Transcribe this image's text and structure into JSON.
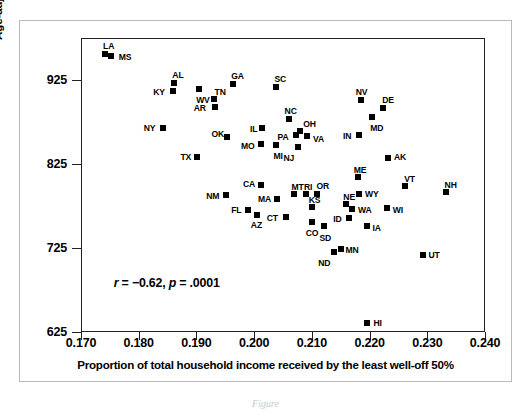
{
  "chart_data": {
    "type": "scatter",
    "title": "",
    "xlabel": "Proportion of total household income received by the least well-off 50%",
    "ylabel": "Age-adjusted total mortality per 100,000",
    "xlim": [
      0.17,
      0.24
    ],
    "ylim": [
      625,
      975
    ],
    "xticks": [
      "0.170",
      "0.180",
      "0.190",
      "0.200",
      "0.210",
      "0.220",
      "0.230",
      "0.240"
    ],
    "xtick_values": [
      0.17,
      0.18,
      0.19,
      0.2,
      0.21,
      0.22,
      0.23,
      0.24
    ],
    "yticks": [
      "925",
      "825",
      "725",
      "625"
    ],
    "ytick_values": [
      925,
      825,
      725,
      625
    ],
    "grid": false,
    "legend": "none",
    "annotation": "r = −0.62, p = .0001",
    "annotation_parts": {
      "r_symbol": "r",
      "r_text": " = −0.62, ",
      "p_symbol": "p",
      "p_text": " = .0001"
    },
    "marker": "filled-square",
    "marker_color": "#000000",
    "points": [
      {
        "label": "LA",
        "x": 0.174,
        "y": 957,
        "lx": -2,
        "ly": -13
      },
      {
        "label": "MS",
        "x": 0.175,
        "y": 955,
        "lx": 8,
        "ly": -4
      },
      {
        "label": "AL",
        "x": 0.186,
        "y": 923,
        "lx": -2,
        "ly": -13
      },
      {
        "label": "KY",
        "x": 0.1858,
        "y": 913,
        "lx": -20,
        "ly": -4
      },
      {
        "label": "WV",
        "x": 0.1903,
        "y": 916,
        "lx": -3,
        "ly": 6
      },
      {
        "label": "GA",
        "x": 0.1962,
        "y": 922,
        "lx": -2,
        "ly": -13
      },
      {
        "label": "TN",
        "x": 0.1928,
        "y": 903,
        "lx": 1,
        "ly": -12
      },
      {
        "label": "AR",
        "x": 0.193,
        "y": 894,
        "lx": -21,
        "ly": -4
      },
      {
        "label": "SC",
        "x": 0.2037,
        "y": 918,
        "lx": -2,
        "ly": -13
      },
      {
        "label": "NV",
        "x": 0.2183,
        "y": 902,
        "lx": -5,
        "ly": -13
      },
      {
        "label": "DE",
        "x": 0.2222,
        "y": 893,
        "lx": -1,
        "ly": -13
      },
      {
        "label": "MD",
        "x": 0.2203,
        "y": 882,
        "lx": -2,
        "ly": 6
      },
      {
        "label": "NC",
        "x": 0.2058,
        "y": 880,
        "lx": -4,
        "ly": -13
      },
      {
        "label": "NY",
        "x": 0.184,
        "y": 869,
        "lx": -19,
        "ly": -5
      },
      {
        "label": "IL",
        "x": 0.2012,
        "y": 869,
        "lx": -12,
        "ly": -4
      },
      {
        "label": "OH",
        "x": 0.2078,
        "y": 866,
        "lx": 3,
        "ly": -12
      },
      {
        "label": "PA",
        "x": 0.207,
        "y": 861,
        "lx": -18,
        "ly": -3
      },
      {
        "label": "VA",
        "x": 0.209,
        "y": 859,
        "lx": 6,
        "ly": -2
      },
      {
        "label": "IN",
        "x": 0.218,
        "y": 861,
        "lx": -16,
        "ly": -4
      },
      {
        "label": "OK",
        "x": 0.1952,
        "y": 858,
        "lx": -16,
        "ly": -8
      },
      {
        "label": "MO",
        "x": 0.201,
        "y": 850,
        "lx": -20,
        "ly": -3
      },
      {
        "label": "MI",
        "x": 0.2037,
        "y": 849,
        "lx": -3,
        "ly": 6
      },
      {
        "label": "NJ",
        "x": 0.2075,
        "y": 846,
        "lx": -15,
        "ly": 6
      },
      {
        "label": "AK",
        "x": 0.223,
        "y": 833,
        "lx": 6,
        "ly": -6
      },
      {
        "label": "TX",
        "x": 0.19,
        "y": 835,
        "lx": -17,
        "ly": -5
      },
      {
        "label": "ME",
        "x": 0.2178,
        "y": 811,
        "lx": -4,
        "ly": -12
      },
      {
        "label": "VT",
        "x": 0.226,
        "y": 800,
        "lx": -1,
        "ly": -12
      },
      {
        "label": "CA",
        "x": 0.201,
        "y": 801,
        "lx": -18,
        "ly": -6
      },
      {
        "label": "NH",
        "x": 0.233,
        "y": 793,
        "lx": -1,
        "ly": -12
      },
      {
        "label": "MT",
        "x": 0.2068,
        "y": 791,
        "lx": -3,
        "ly": -12
      },
      {
        "label": "RI",
        "x": 0.2088,
        "y": 791,
        "lx": -2,
        "ly": -12
      },
      {
        "label": "OR",
        "x": 0.2108,
        "y": 791,
        "lx": -1,
        "ly": -13
      },
      {
        "label": "WY",
        "x": 0.218,
        "y": 791,
        "lx": 6,
        "ly": -5
      },
      {
        "label": "NM",
        "x": 0.195,
        "y": 789,
        "lx": -20,
        "ly": -4
      },
      {
        "label": "MA",
        "x": 0.2038,
        "y": 784,
        "lx": -19,
        "ly": -5
      },
      {
        "label": "KS",
        "x": 0.2098,
        "y": 775,
        "lx": -3,
        "ly": -12
      },
      {
        "label": "NE",
        "x": 0.2158,
        "y": 778,
        "lx": -3,
        "ly": -12
      },
      {
        "label": "WA",
        "x": 0.2168,
        "y": 773,
        "lx": 6,
        "ly": -4
      },
      {
        "label": "WI",
        "x": 0.2228,
        "y": 774,
        "lx": 6,
        "ly": -3
      },
      {
        "label": "FL",
        "x": 0.1988,
        "y": 772,
        "lx": -17,
        "ly": -5
      },
      {
        "label": "AZ",
        "x": 0.2003,
        "y": 766,
        "lx": -6,
        "ly": 5
      },
      {
        "label": "CT",
        "x": 0.2053,
        "y": 763,
        "lx": -19,
        "ly": -4
      },
      {
        "label": "ID",
        "x": 0.2163,
        "y": 762,
        "lx": -16,
        "ly": -4
      },
      {
        "label": "CO",
        "x": 0.2098,
        "y": 757,
        "lx": -6,
        "ly": 6
      },
      {
        "label": "SD",
        "x": 0.212,
        "y": 752,
        "lx": -5,
        "ly": 7
      },
      {
        "label": "IA",
        "x": 0.2193,
        "y": 752,
        "lx": 6,
        "ly": -3
      },
      {
        "label": "MN",
        "x": 0.2148,
        "y": 725,
        "lx": 5,
        "ly": -4
      },
      {
        "label": "ND",
        "x": 0.2137,
        "y": 722,
        "lx": -16,
        "ly": 6
      },
      {
        "label": "UT",
        "x": 0.229,
        "y": 718,
        "lx": 6,
        "ly": -5
      },
      {
        "label": "HI",
        "x": 0.2193,
        "y": 637,
        "lx": 7,
        "ly": -5
      }
    ]
  },
  "caption": "Figure"
}
